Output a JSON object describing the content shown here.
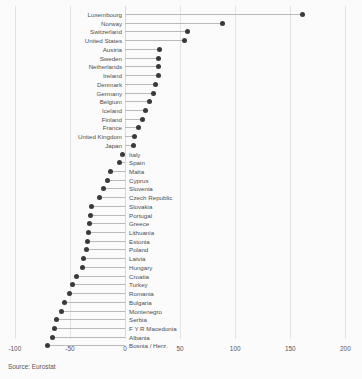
{
  "chart_data": {
    "type": "bar",
    "title": "",
    "subtitle": "",
    "xlabel": "",
    "ylabel": "",
    "xlim": [
      -100,
      200
    ],
    "xticks": [
      -100,
      -50,
      0,
      50,
      100,
      150,
      200
    ],
    "xtick_labels": [
      "-100",
      "-50",
      "0",
      "50",
      "100",
      "150",
      "200"
    ],
    "grid": true,
    "legend": null,
    "orientation": "horizontal",
    "marker": "circle",
    "categories": [
      "Luxembourg",
      "Norway",
      "Switzerland",
      "United States",
      "Austria",
      "Sweden",
      "Netherlands",
      "Ireland",
      "Denmark",
      "Germany",
      "Belgium",
      "Iceland",
      "Finland",
      "France",
      "United Kingdom",
      "Japan",
      "Italy",
      "Spain",
      "Malta",
      "Cyprus",
      "Slovenia",
      "Czech Republic",
      "Slovakia",
      "Portugal",
      "Greece",
      "Lithuania",
      "Estonia",
      "Poland",
      "Latvia",
      "Hungary",
      "Croatia",
      "Turkey",
      "Romania",
      "Bulgaria",
      "Montenegro",
      "Serbia",
      "F Y R Macedonia",
      "Albania",
      "Bosnia / Herz."
    ],
    "values": [
      161,
      88,
      57,
      54,
      31,
      30,
      30,
      30,
      28,
      26,
      22,
      19,
      16,
      12,
      9,
      8,
      -2,
      -5,
      -13,
      -16,
      -20,
      -23,
      -30,
      -31,
      -32,
      -33,
      -34,
      -35,
      -38,
      -39,
      -44,
      -48,
      -50,
      -55,
      -58,
      -62,
      -64,
      -66,
      -70
    ]
  },
  "footer": {
    "source": "Source: Eurostat"
  }
}
